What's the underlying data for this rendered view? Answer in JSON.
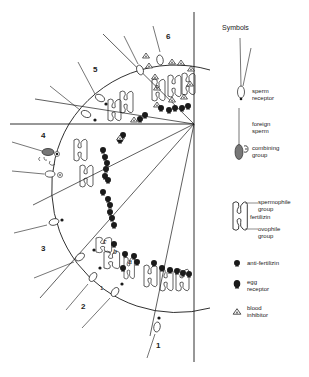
{
  "diagram": {
    "section_labels": [
      "1",
      "2",
      "3",
      "4",
      "5",
      "6"
    ],
    "cell_letters": [
      "a",
      "b",
      "c"
    ],
    "small_label": "1"
  },
  "legend": {
    "title": "Symbols",
    "items": [
      {
        "icon": "sperm-receptor-icon",
        "label": "sperm\nreceptor"
      },
      {
        "icon": "foreign-sperm-icon",
        "label": "foreign\nsperm"
      },
      {
        "icon": "combining-group-icon",
        "label": "combining\ngroup"
      },
      {
        "icon": "spermophile-group-icon",
        "label": "spermophile\ngroup"
      },
      {
        "icon": "fertilizin-icon",
        "label": "fertilizin"
      },
      {
        "icon": "ovophile-group-icon",
        "label": "ovophile\ngroup"
      },
      {
        "icon": "anti-fertilizin-icon",
        "label": "anti-fertilizin"
      },
      {
        "icon": "egg-receptor-icon",
        "label": "egg\nreceptor"
      },
      {
        "icon": "blood-inhibitor-icon",
        "label": "blood\ninhibitor"
      }
    ]
  },
  "colors": {
    "line": "#1a1a1a",
    "fill_dark": "#1a1a1a",
    "fill_gray": "#777777",
    "background": "#ffffff"
  }
}
